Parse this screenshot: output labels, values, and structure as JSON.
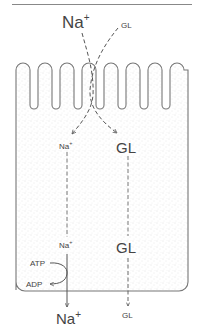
{
  "diagram": {
    "colors": {
      "outline": "#777777",
      "text": "#444444",
      "stipple": "#bdbdbd",
      "background": "#ffffff"
    },
    "labels": {
      "lumen_na": {
        "base": "Na",
        "sup": "+"
      },
      "lumen_gl": "GL",
      "apical_na": {
        "base": "Na",
        "sup": "+"
      },
      "apical_gl": "GL",
      "basal_na": {
        "base": "Na",
        "sup": "+"
      },
      "basal_gl": "GL",
      "atp": "ATP",
      "adp": "ADP",
      "exit_na": {
        "base": "Na",
        "sup": "+"
      },
      "exit_gl": "GL"
    },
    "structure": {
      "microvilli_count": 7,
      "regions": [
        "lumen",
        "apical membrane (microvilli)",
        "cytoplasm",
        "basolateral membrane",
        "interstitium"
      ]
    },
    "flows": [
      {
        "name": "na-entry",
        "from": "lumen_na",
        "to": "apical_na",
        "style": "dashed"
      },
      {
        "name": "gl-entry",
        "from": "lumen_gl",
        "to": "apical_gl",
        "style": "dashed"
      },
      {
        "name": "na-transit",
        "from": "apical_na",
        "to": "basal_na",
        "style": "dashed"
      },
      {
        "name": "gl-transit",
        "from": "apical_gl",
        "to": "exit_gl",
        "style": "dashed"
      },
      {
        "name": "na-exit",
        "from": "basal_na",
        "to": "exit_na",
        "style": "solid"
      },
      {
        "name": "atp-hydrolysis",
        "from": "atp",
        "to": "adp",
        "style": "solid"
      }
    ]
  }
}
